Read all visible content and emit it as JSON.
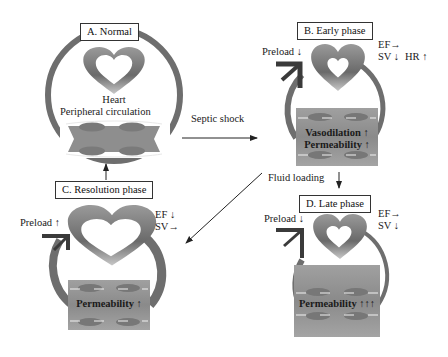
{
  "colors": {
    "heart": "#7a7a7a",
    "loop": "#6e6e6e",
    "preload_arrow": "#3a3a3a",
    "tissue": "#8c8c8c",
    "vessel_cell": "#777777"
  },
  "panels": {
    "A": {
      "title": "A. Normal",
      "heart_label": "Heart",
      "circulation_label": "Peripheral circulation"
    },
    "B": {
      "title": "B. Early phase",
      "preload": "Preload ↓",
      "ef": "EF→",
      "sv": "SV ↓",
      "hr": "HR ↑",
      "tissue_line1": "Vasodilation ↑",
      "tissue_line2": "Permeability ↑"
    },
    "C": {
      "title": "C. Resolution phase",
      "preload": "Preload ↑",
      "ef": "EF ↓",
      "sv": "SV→",
      "tissue_line1": "Permeability ↑"
    },
    "D": {
      "title": "D. Late phase",
      "preload": "Preload ↓",
      "ef": "EF→",
      "sv": "SV ↓",
      "tissue_line1": "Permeability ↑↑↑"
    }
  },
  "transitions": {
    "a_to_b": "Septic shock",
    "b_to_d": "Fluid loading"
  }
}
